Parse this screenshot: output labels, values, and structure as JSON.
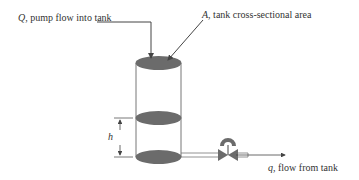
{
  "labels": {
    "pump_flow": {
      "symbol": "Q",
      "text": ", pump flow into tank"
    },
    "area": {
      "symbol": "A",
      "text": ", tank cross-sectional area"
    },
    "height": {
      "symbol": "h"
    },
    "outflow": {
      "symbol": "q",
      "text": ", flow from tank"
    }
  },
  "colors": {
    "liquid": "#6b6b6b",
    "line": "#555555",
    "text": "#333333"
  }
}
